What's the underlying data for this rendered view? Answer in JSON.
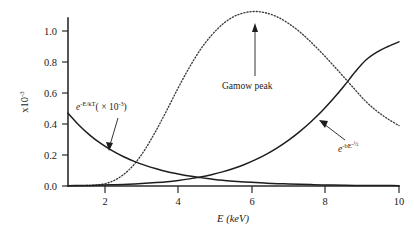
{
  "figure": {
    "name": "gamow-peak-figure",
    "background": "#ffffff",
    "ink": "#1a1a1a"
  },
  "chart_data": {
    "type": "line",
    "title": "",
    "xlabel": "E (keV)",
    "ylabel": "x10",
    "ylabel_exponent": "-3",
    "xlim": [
      1,
      10
    ],
    "ylim": [
      0.0,
      1.2
    ],
    "grid": false,
    "legend": "none",
    "xticks": [
      2,
      4,
      6,
      8,
      10
    ],
    "xticklabels": [
      "2",
      "4",
      "6",
      "8",
      "10"
    ],
    "yticks": [
      0.0,
      0.2,
      0.4,
      0.6,
      0.8,
      1.0
    ],
    "yticklabels": [
      "0.0",
      "0.2",
      "0.4",
      "0.6",
      "0.8",
      "1.0"
    ],
    "x": [
      1.0,
      1.3,
      1.6,
      1.9,
      2.2,
      2.5,
      2.8,
      3.1,
      3.4,
      3.7,
      4.0,
      4.3,
      4.6,
      4.9,
      5.2,
      5.5,
      5.8,
      6.1,
      6.4,
      6.7,
      7.0,
      7.3,
      7.6,
      7.9,
      8.2,
      8.5,
      8.8,
      9.1,
      9.4,
      9.7,
      10.0
    ],
    "series": [
      {
        "name": "maxwell-boltzmann",
        "label": "e",
        "label_exponent": "-E/kT",
        "label_suffix": "( × 10",
        "label_suffix_exponent": "-3",
        "label_suffix_close": ")",
        "style": "solid",
        "color": "#1d1d1d",
        "values": [
          0.47,
          0.392,
          0.327,
          0.273,
          0.228,
          0.19,
          0.159,
          0.133,
          0.111,
          0.092,
          0.077,
          0.064,
          0.054,
          0.045,
          0.037,
          0.031,
          0.026,
          0.022,
          0.018,
          0.015,
          0.013,
          0.011,
          0.009,
          0.007,
          0.006,
          0.005,
          0.004,
          0.004,
          0.003,
          0.003,
          0.002
        ]
      },
      {
        "name": "tunneling-probability",
        "label": "e",
        "label_exponent": "-bE",
        "label_exponent2": "-½",
        "style": "solid",
        "color": "#1d1d1d",
        "values": [
          0.002,
          0.003,
          0.004,
          0.006,
          0.008,
          0.01,
          0.013,
          0.017,
          0.022,
          0.028,
          0.036,
          0.046,
          0.058,
          0.073,
          0.091,
          0.113,
          0.139,
          0.17,
          0.206,
          0.248,
          0.296,
          0.351,
          0.413,
          0.482,
          0.559,
          0.643,
          0.734,
          0.813,
          0.864,
          0.9,
          0.93
        ]
      },
      {
        "name": "gamow-peak-product",
        "label": "Gamow peak",
        "style": "dotted",
        "color": "#3a3a3a",
        "values": [
          0.001,
          0.002,
          0.004,
          0.01,
          0.03,
          0.072,
          0.14,
          0.238,
          0.36,
          0.495,
          0.635,
          0.765,
          0.88,
          0.972,
          1.043,
          1.092,
          1.118,
          1.126,
          1.116,
          1.09,
          1.048,
          0.995,
          0.93,
          0.858,
          0.782,
          0.703,
          0.623,
          0.545,
          0.483,
          0.432,
          0.39
        ]
      }
    ],
    "annotations": [
      {
        "name": "gamow-peak-annotation",
        "text": "Gamow peak",
        "points_to_x": 6.0,
        "points_to_y": 1.126
      },
      {
        "name": "maxwell-boltzmann-annotation",
        "points_to_x": 2.15,
        "points_to_y": 0.215
      },
      {
        "name": "tunneling-annotation",
        "points_to_x": 8.1,
        "points_to_y": 0.535
      }
    ]
  }
}
